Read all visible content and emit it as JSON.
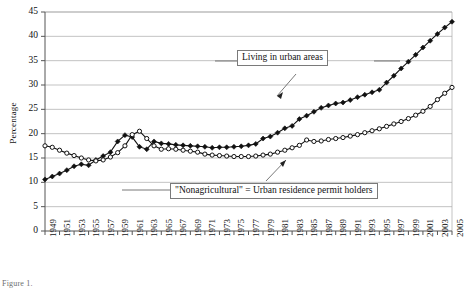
{
  "chart_data": {
    "type": "line",
    "title": "",
    "xlabel": "",
    "ylabel": "Percentage",
    "ylim": [
      0,
      45
    ],
    "ytick_step": 5,
    "yticks": [
      0,
      5,
      10,
      15,
      20,
      25,
      30,
      35,
      40,
      45
    ],
    "xlim": [
      1949,
      2005
    ],
    "xticks": [
      1949,
      1951,
      1953,
      1955,
      1957,
      1959,
      1961,
      1963,
      1965,
      1967,
      1969,
      1971,
      1973,
      1975,
      1977,
      1979,
      1981,
      1983,
      1985,
      1987,
      1989,
      1991,
      1993,
      1995,
      1997,
      1999,
      2001,
      2003,
      2005
    ],
    "grid": "horizontal",
    "legend_position": "inline-annotations",
    "x": [
      1949,
      1950,
      1951,
      1952,
      1953,
      1954,
      1955,
      1956,
      1957,
      1958,
      1959,
      1960,
      1961,
      1962,
      1963,
      1964,
      1965,
      1966,
      1967,
      1968,
      1969,
      1970,
      1971,
      1972,
      1973,
      1974,
      1975,
      1976,
      1977,
      1978,
      1979,
      1980,
      1981,
      1982,
      1983,
      1984,
      1985,
      1986,
      1987,
      1988,
      1989,
      1990,
      1991,
      1992,
      1993,
      1994,
      1995,
      1996,
      1997,
      1998,
      1999,
      2000,
      2001,
      2002,
      2003,
      2004,
      2005
    ],
    "series": [
      {
        "name": "Living in urban areas",
        "marker": "filled-diamond",
        "color": "#111111",
        "values": [
          10.6,
          11.2,
          11.8,
          12.5,
          13.3,
          13.7,
          13.5,
          14.6,
          15.4,
          16.2,
          18.4,
          19.7,
          19.3,
          17.3,
          16.8,
          18.4,
          18.0,
          17.9,
          17.7,
          17.6,
          17.5,
          17.4,
          17.3,
          17.1,
          17.2,
          17.2,
          17.3,
          17.4,
          17.6,
          17.9,
          19.0,
          19.4,
          20.2,
          21.1,
          21.6,
          23.0,
          23.7,
          24.5,
          25.3,
          25.8,
          26.2,
          26.4,
          26.9,
          27.5,
          28.0,
          28.5,
          29.0,
          30.5,
          31.9,
          33.4,
          34.8,
          36.2,
          37.7,
          39.1,
          40.5,
          41.8,
          43.0
        ]
      },
      {
        "name": "\"Nonagricultural\" = Urban residence permit holders",
        "marker": "hollow-circle",
        "color": "#111111",
        "values": [
          17.5,
          17.2,
          16.6,
          16.0,
          15.5,
          15.0,
          14.6,
          14.4,
          14.6,
          15.2,
          16.1,
          17.5,
          19.8,
          20.5,
          19.0,
          17.5,
          16.8,
          16.9,
          16.8,
          16.6,
          16.4,
          16.2,
          15.8,
          15.6,
          15.5,
          15.4,
          15.3,
          15.3,
          15.3,
          15.4,
          15.6,
          15.8,
          16.2,
          16.6,
          17.1,
          17.6,
          18.7,
          18.4,
          18.5,
          18.8,
          19.0,
          19.2,
          19.5,
          19.8,
          20.2,
          20.6,
          21.0,
          21.5,
          22.0,
          22.5,
          23.1,
          23.8,
          24.6,
          25.6,
          27.0,
          28.3,
          29.5
        ]
      }
    ],
    "annotations": [
      {
        "id": "urban",
        "text": "Living in urban areas",
        "points_to_year": 1984
      },
      {
        "id": "nonagricultural",
        "text": "\"Nonagricultural\" = Urban residence permit holders",
        "points_to_year": 1987
      }
    ]
  },
  "footer": {
    "note": "Figure 1."
  }
}
